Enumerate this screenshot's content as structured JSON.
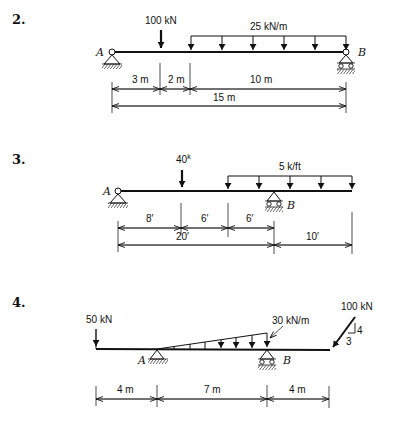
{
  "problems": [
    {
      "number": "2.",
      "loads": {
        "point": "100 kN",
        "distributed": "25 kN/m"
      },
      "supports": {
        "left": "A",
        "right": "B"
      },
      "dimensions": {
        "d1": "3 m",
        "d2": "2 m",
        "d3": "10 m",
        "total": "15 m"
      }
    },
    {
      "number": "3.",
      "loads": {
        "point": "40",
        "point_sup": "k",
        "distributed": "5 k/ft"
      },
      "supports": {
        "left": "A",
        "right": "B"
      },
      "dimensions": {
        "d1": "8′",
        "d2": "6′",
        "d3": "6′",
        "span": "20′",
        "overhang": "10′"
      }
    },
    {
      "number": "4.",
      "loads": {
        "point_left": "50 kN",
        "distributed": "30 kN/m",
        "inclined": "100 kN",
        "slope_v": "4",
        "slope_h": "3"
      },
      "supports": {
        "left": "A",
        "right": "B"
      },
      "dimensions": {
        "d1": "4 m",
        "d2": "7 m",
        "d3": "4 m"
      }
    }
  ]
}
